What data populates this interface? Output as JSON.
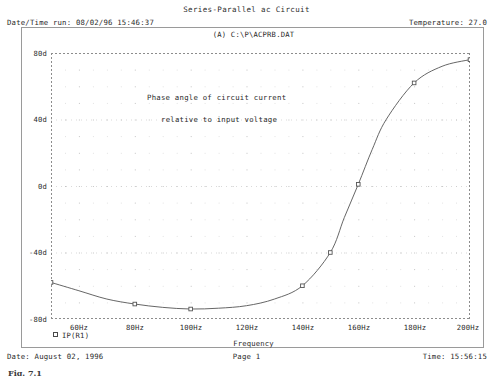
{
  "header": {
    "title": "Series-Parallel ac Circuit",
    "datetime_label": "Date/Time run: 08/02/96 15:46:37",
    "temperature_label": "Temperature: 27.0"
  },
  "plot_header": {
    "dataset_label": "(A)  C:\\P\\ACPRB.DAT"
  },
  "annotation": {
    "line1": "Phase angle of circuit current",
    "line2": "relative to input voltage"
  },
  "legend": {
    "marker": "square",
    "series_label": "IP(R1)"
  },
  "axis_titles": {
    "x": "Frequency"
  },
  "footer": {
    "date": "Date: August 02, 1996",
    "page": "Page 1",
    "time": "Time: 15:56:15",
    "caption": "Fig. 7.1"
  },
  "colors": {
    "trace": "#555555",
    "axis": "#8c8c8c",
    "grid": "#cfcfcf",
    "frame": "#9a9a9a",
    "text": "#2a2a2a",
    "background": "#ffffff"
  },
  "chart_data": {
    "type": "line",
    "title": "Series-Parallel ac Circuit",
    "subtitle": "(A)  C:\\P\\ACPRB.DAT",
    "xlabel": "Frequency",
    "ylabel": "",
    "xlim": [
      50,
      200
    ],
    "ylim": [
      -80,
      80
    ],
    "xtick_labels": [
      "60Hz",
      "80Hz",
      "100Hz",
      "120Hz",
      "140Hz",
      "160Hz",
      "180Hz",
      "200Hz"
    ],
    "xticks": [
      60,
      80,
      100,
      120,
      140,
      160,
      180,
      200
    ],
    "ytick_labels": [
      "80d",
      "40d",
      "0d",
      "-40d",
      "-80d"
    ],
    "yticks": [
      80,
      40,
      0,
      -40,
      -80
    ],
    "grid": true,
    "legend_position": "below-axes-left",
    "series": [
      {
        "name": "IP(R1)",
        "marker": "square",
        "x": [
          50,
          60,
          70,
          80,
          90,
          100,
          110,
          120,
          130,
          140,
          150,
          155,
          160,
          165,
          170,
          180,
          190,
          200
        ],
        "y": [
          -58,
          -63,
          -68,
          -71,
          -73,
          -74,
          -73.5,
          -72,
          -68,
          -60,
          -40,
          -19,
          1,
          22,
          40,
          62,
          72,
          76
        ],
        "marker_x": [
          50,
          80,
          100,
          140,
          150,
          160,
          180,
          200
        ],
        "marker_y": [
          -58,
          -71,
          -74,
          -60,
          -40,
          1,
          62,
          76
        ]
      }
    ],
    "annotations": [
      {
        "text": "Phase angle of circuit current",
        "x": 112,
        "y": 47
      },
      {
        "text": "relative to input voltage",
        "x": 117,
        "y": 33
      }
    ]
  }
}
